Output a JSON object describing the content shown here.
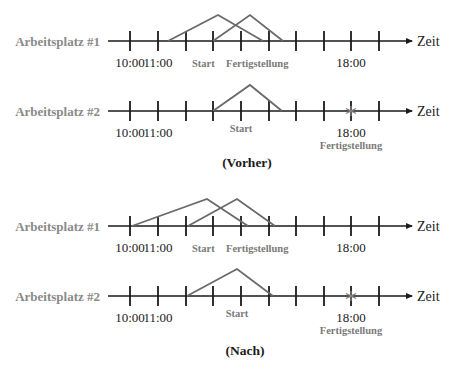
{
  "axis_end_label": "Zeit",
  "colors": {
    "axis": "#1a1a1a",
    "task_line": "#6a6a6a",
    "workstation_label": "#8a8a8a",
    "marker_label": "#7a7a7a",
    "star_marker": "#8a7f78"
  },
  "tick_x": [
    130,
    158,
    186,
    213,
    241,
    269,
    296,
    324,
    351,
    379
  ],
  "panels": [
    {
      "caption": "(Vorher)",
      "caption_x": 247,
      "caption_y": 167,
      "rows": [
        {
          "workstation": "Arbeitsplatz #1",
          "baseline_y": 41,
          "time_labels": [
            {
              "text": "10:00",
              "x": 130
            },
            {
              "text": "11:00",
              "x": 158
            },
            {
              "text": "18:00",
              "x": 351
            }
          ],
          "marker_labels": [
            {
              "text": "Start",
              "x": 213,
              "dy": 28
            },
            {
              "text": "Fertigstellung",
              "x": 255,
              "dy": 28
            }
          ],
          "tasks": [
            {
              "start_x": 168,
              "apex_x": 218,
              "apex_y": 15,
              "end_x": 263
            },
            {
              "start_x": 213,
              "apex_x": 250,
              "apex_y": 15,
              "end_x": 283
            }
          ],
          "star_x": null
        },
        {
          "workstation": "Arbeitsplatz #2",
          "baseline_y": 111,
          "time_labels": [
            {
              "text": "10:00",
              "x": 130
            },
            {
              "text": "11:00",
              "x": 158
            },
            {
              "text": "18:00",
              "x": 351
            }
          ],
          "marker_labels": [
            {
              "text": "Start",
              "x": 241,
              "dy": 23
            },
            {
              "text": "Fertigstellung",
              "x": 351,
              "dy": 40
            }
          ],
          "tasks": [
            {
              "start_x": 213,
              "apex_x": 250,
              "apex_y": 85,
              "end_x": 282
            }
          ],
          "star_x": 351
        }
      ]
    },
    {
      "caption": "(Nach)",
      "caption_x": 245,
      "caption_y": 355,
      "rows": [
        {
          "workstation": "Arbeitsplatz #1",
          "baseline_y": 226,
          "time_labels": [
            {
              "text": "10:00",
              "x": 130
            },
            {
              "text": "11:00",
              "x": 158
            },
            {
              "text": "18:00",
              "x": 351
            }
          ],
          "marker_labels": [
            {
              "text": "Start",
              "x": 213,
              "dy": 28
            },
            {
              "text": "Fertigstellung",
              "x": 255,
              "dy": 28
            }
          ],
          "tasks": [
            {
              "start_x": 132,
              "apex_x": 207,
              "apex_y": 199,
              "end_x": 248
            },
            {
              "start_x": 188,
              "apex_x": 237,
              "apex_y": 199,
              "end_x": 275
            }
          ],
          "star_x": null
        },
        {
          "workstation": "Arbeitsplatz #2",
          "baseline_y": 296,
          "time_labels": [
            {
              "text": "10:00",
              "x": 130
            },
            {
              "text": "11:00",
              "x": 158
            },
            {
              "text": "18:00",
              "x": 351
            }
          ],
          "marker_labels": [
            {
              "text": "Start",
              "x": 237,
              "dy": 23
            },
            {
              "text": "Fertigstellung",
              "x": 351,
              "dy": 40
            }
          ],
          "tasks": [
            {
              "start_x": 187,
              "apex_x": 237,
              "apex_y": 269,
              "end_x": 273
            }
          ],
          "star_x": 351
        }
      ]
    }
  ],
  "axis": {
    "start_x": 108,
    "end_x": 412,
    "label_x": 417
  }
}
